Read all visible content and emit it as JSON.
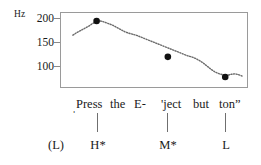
{
  "figure": {
    "kind": "pitch-contour",
    "axis": {
      "unit_label": "Hz",
      "ticks": [
        "200",
        "150",
        "100"
      ]
    },
    "utterance": {
      "low_boundary_mark": "ˌ",
      "words": [
        "Press",
        "the",
        "E-",
        "'ject",
        "but",
        "ton”"
      ]
    },
    "tone_tier": {
      "labels": [
        "(L)",
        "H*",
        "M*",
        "L"
      ]
    },
    "colors": {
      "frame": "#9a9a9a",
      "trace": "#6b6b6b",
      "marker": "#111111",
      "text": "#1a1a1a",
      "leader": "#6f6f6f",
      "background": "#ffffff"
    }
  },
  "chart_data": {
    "type": "line",
    "title": "",
    "xlabel": "",
    "ylabel": "Hz",
    "ylim": [
      75,
      215
    ],
    "xlim": [
      0,
      188
    ],
    "grid": false,
    "legend": null,
    "yticks": [
      200,
      150,
      100
    ],
    "series": [
      {
        "name": "F0 contour",
        "style": "dotted",
        "x": [
          12,
          16,
          20,
          24,
          28,
          31,
          34,
          36,
          39,
          42,
          45,
          48,
          52,
          56,
          60,
          64,
          68,
          72,
          76,
          80,
          84,
          88,
          92,
          96,
          100,
          104,
          108,
          112,
          116,
          120,
          124,
          128,
          132,
          136,
          140,
          144,
          148,
          152,
          156,
          160,
          164,
          168,
          172,
          176,
          180,
          184
        ],
        "y": [
          173,
          178,
          182,
          186,
          190,
          194,
          197,
          199,
          200,
          199,
          197,
          195,
          192,
          188,
          184,
          180,
          177,
          175,
          173,
          170,
          167,
          164,
          161,
          158,
          155,
          152,
          149,
          146,
          143,
          140,
          137,
          134,
          132,
          129,
          125,
          120,
          114,
          108,
          103,
          100,
          98,
          97,
          99,
          100,
          98,
          95
        ]
      }
    ],
    "markers": [
      {
        "label": "H*",
        "x": 36,
        "y": 200
      },
      {
        "label": "M*",
        "x": 108,
        "y": 132
      },
      {
        "label": "L",
        "x": 166,
        "y": 94
      }
    ]
  }
}
